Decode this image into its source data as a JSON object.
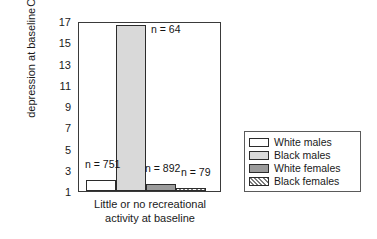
{
  "chart_data": {
    "type": "bar",
    "title": "",
    "xlabel": "Little or no recreational activity at baseline",
    "xlabel_lines": [
      "Little or no recreational",
      "activity at baseline"
    ],
    "ylabel": "Odds ratio for depression at baseline",
    "ylabel_lines": [
      "Odds ratio for",
      "depression at baseline"
    ],
    "ylim": [
      1,
      17
    ],
    "yticks": [
      1,
      3,
      5,
      7,
      9,
      11,
      13,
      15,
      17
    ],
    "ytick_labels": [
      "1",
      "3",
      "5",
      "7",
      "9",
      "11",
      "13",
      "15",
      "17"
    ],
    "grid": false,
    "legend_position": "right-outside",
    "categories": [
      "White males",
      "Black males",
      "White females",
      "Black females"
    ],
    "values": [
      2.0,
      16.6,
      1.7,
      1.3
    ],
    "annotations": [
      "n = 751",
      "n = 64",
      "n = 892",
      "n = 79"
    ],
    "series": [
      {
        "name": "White males",
        "value": 2.0,
        "n_label": "n = 751",
        "fill": "white",
        "color": "#ffffff"
      },
      {
        "name": "Black males",
        "value": 16.6,
        "n_label": "n = 64",
        "fill": "lightgray",
        "color": "#d9d9d9"
      },
      {
        "name": "White females",
        "value": 1.7,
        "n_label": "n = 892",
        "fill": "darkgray",
        "color": "#9b9b9b"
      },
      {
        "name": "Black females",
        "value": 1.3,
        "n_label": "n = 79",
        "fill": "hatch",
        "color": "#7d7d7d"
      }
    ]
  },
  "legend": {
    "items": [
      {
        "label": "White males",
        "fill": "white"
      },
      {
        "label": "Black males",
        "fill": "lightgray"
      },
      {
        "label": "White females",
        "fill": "darkgray"
      },
      {
        "label": "Black females",
        "fill": "hatch"
      }
    ]
  }
}
